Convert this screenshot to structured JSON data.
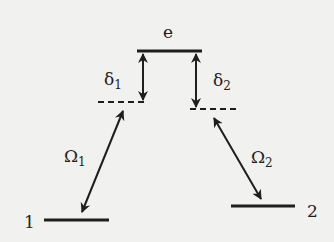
{
  "diagram": {
    "type": "three-level lambda energy diagram",
    "levels": {
      "excited": {
        "label": "e"
      },
      "ground1": {
        "label": "1"
      },
      "ground2": {
        "label": "2"
      }
    },
    "detunings": {
      "d1": {
        "symbol": "δ",
        "sub": "1"
      },
      "d2": {
        "symbol": "δ",
        "sub": "2"
      }
    },
    "couplings": {
      "o1": {
        "symbol": "Ω",
        "sub": "1"
      },
      "o2": {
        "symbol": "Ω",
        "sub": "2"
      }
    },
    "colors": {
      "line": "#1e1e1e",
      "background": "#f1f1ef"
    }
  }
}
